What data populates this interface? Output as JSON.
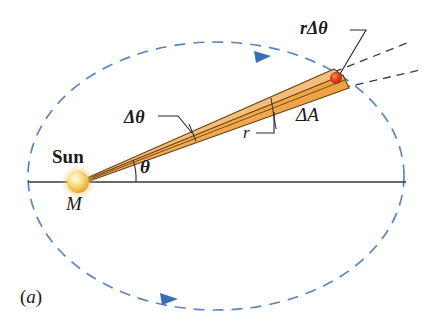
{
  "figure": {
    "panel_label_open": "(",
    "panel_label_letter": "a",
    "panel_label_close": ")",
    "caption_id": "(a)"
  },
  "labels": {
    "sun": "Sun",
    "mass": "M",
    "theta": "θ",
    "delta_theta": "Δθ",
    "radius": "r",
    "delta_area": "ΔA",
    "arc_length": "rΔθ"
  },
  "colors": {
    "orbit_dashed": "#5b84c4",
    "orbit_arrow": "#3a6fb5",
    "wedge_fill": "#efa84f",
    "wedge_fill_light": "#f5c07a",
    "wedge_edge": "#6b3f12",
    "sun_core": "#fff6d0",
    "sun_mid": "#f8cf5e",
    "sun_rim": "#e8a63a",
    "planet": "#e0341a",
    "planet_edge": "#a02410",
    "axis_line": "#3a3a38",
    "leader_line": "#262624",
    "text": "#1a1a18",
    "background": "#ffffff"
  },
  "geometry": {
    "sun_center": {
      "x": 78,
      "y": 182
    },
    "sun_radius": 11,
    "planet_point": {
      "x": 336,
      "y": 78
    },
    "orbit_center": {
      "x": 216,
      "y": 176
    },
    "orbit_rx": 188,
    "orbit_ry": 134,
    "axis_start": {
      "x": 28,
      "y": 182
    },
    "axis_end": {
      "x": 406,
      "y": 182
    },
    "theta_degrees": 22,
    "wedge_delta_theta_degrees": 5
  },
  "elements": {
    "orbit_name": "dashed elliptical orbit",
    "wedge_name": "swept area wedge",
    "planet_name": "orbiting planet",
    "sun_name": "sun body",
    "axis_name": "major axis line",
    "arrow_top": "orbit direction arrow (top)",
    "arrow_bottom": "orbit direction arrow (bottom)"
  }
}
